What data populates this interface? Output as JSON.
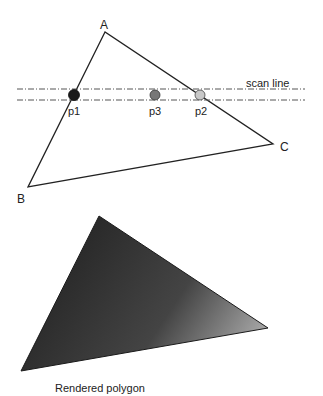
{
  "diagram": {
    "vertices": [
      {
        "label": "A",
        "x": 105,
        "y": 32,
        "label_x": 100,
        "label_y": 29
      },
      {
        "label": "B",
        "x": 28,
        "y": 187,
        "label_x": 17,
        "label_y": 203
      },
      {
        "label": "C",
        "x": 273,
        "y": 144,
        "label_x": 280,
        "label_y": 151
      }
    ],
    "scan_line": {
      "label": "scan line",
      "upper_y": 89,
      "lower_y": 100,
      "x_start": 17,
      "x_end": 305,
      "label_x": 246,
      "label_y": 87
    },
    "points": [
      {
        "label": "p1",
        "x": 74,
        "y": 95,
        "color": "#1a1a1a",
        "label_x": 68,
        "label_y": 115
      },
      {
        "label": "p3",
        "x": 155,
        "y": 95,
        "color": "#777777",
        "label_x": 149,
        "label_y": 115
      },
      {
        "label": "p2",
        "x": 200,
        "y": 95,
        "color": "#c8c8c8",
        "label_x": 195,
        "label_y": 115
      }
    ],
    "rendered_polygon": {
      "caption": "Rendered polygon",
      "vertices": [
        {
          "x": 99,
          "y": 216
        },
        {
          "x": 21,
          "y": 371
        },
        {
          "x": 268,
          "y": 328
        }
      ],
      "gradient": {
        "dark_color": "#2a2a2a",
        "mid_color": "#4a4a4a",
        "light_color": "#a8a8a8"
      },
      "caption_x": 55,
      "caption_y": 392
    },
    "colors": {
      "stroke": "#222222",
      "scan_line": "#555555",
      "background": "#ffffff"
    }
  }
}
